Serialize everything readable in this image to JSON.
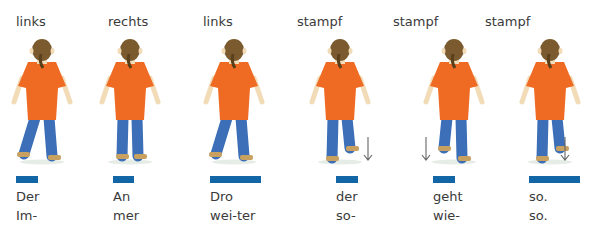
{
  "colors": {
    "bar": "#1366a6",
    "shirt": "#ef6a22",
    "jeans": "#3c6fb8",
    "hair": "#7a5a2e",
    "skin": "#f2dcb8"
  },
  "columns": [
    {
      "label": "links",
      "label_x": 16,
      "figure_x": 8,
      "step": "left",
      "arrow": false,
      "bar_x": 16,
      "bar_w": 22,
      "syllables": [
        "Der",
        "Im-"
      ],
      "syl_x": 16
    },
    {
      "label": "rechts",
      "label_x": 108,
      "figure_x": 96,
      "step": "right",
      "arrow": false,
      "bar_x": 113,
      "bar_w": 21,
      "syllables": [
        "An",
        "mer"
      ],
      "syl_x": 113
    },
    {
      "label": "links",
      "label_x": 203,
      "figure_x": 200,
      "step": "left",
      "arrow": false,
      "bar_x": 210,
      "bar_w": 51,
      "syllables": [
        "Dro",
        "wei-ter"
      ],
      "syl_x": 210
    },
    {
      "label": "stampf",
      "label_x": 297,
      "figure_x": 306,
      "step": "stamp-right",
      "arrow": true,
      "arrow_x": 367,
      "bar_x": 336,
      "bar_w": 22,
      "syllables": [
        "der",
        "so-"
      ],
      "syl_x": 336
    },
    {
      "label": "stampf",
      "label_x": 393,
      "figure_x": 420,
      "step": "stamp-left",
      "arrow": true,
      "arrow_x": 425,
      "bar_x": 433,
      "bar_w": 22,
      "syllables": [
        "geht",
        "wie-"
      ],
      "syl_x": 433
    },
    {
      "label": "stampf",
      "label_x": 485,
      "figure_x": 516,
      "step": "stamp-right",
      "arrow": true,
      "arrow_x": 564,
      "bar_x": 529,
      "bar_w": 51,
      "syllables": [
        "so.",
        "so."
      ],
      "syl_x": 529
    }
  ]
}
